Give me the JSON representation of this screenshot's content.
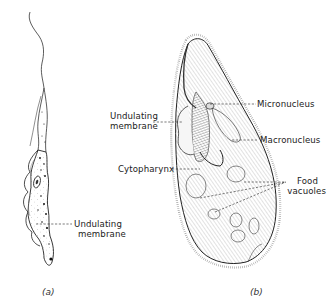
{
  "figure": {
    "panels": [
      {
        "id": "a",
        "caption": "(a)",
        "subject": "flagellate",
        "labels": [
          {
            "text_line1": "Undulating",
            "text_line2": "membrane"
          }
        ]
      },
      {
        "id": "b",
        "caption": "(b)",
        "subject": "ciliate",
        "labels": [
          {
            "text_line1": "Undulating",
            "text_line2": "membrane"
          },
          {
            "text": "Cytopharynx"
          },
          {
            "text": "Micronucleus"
          },
          {
            "text": "Macronucleus"
          },
          {
            "text_line1": "Food",
            "text_line2": "vacuoles"
          }
        ]
      }
    ],
    "colors": {
      "ink": "#222222",
      "background": "#ffffff"
    }
  }
}
